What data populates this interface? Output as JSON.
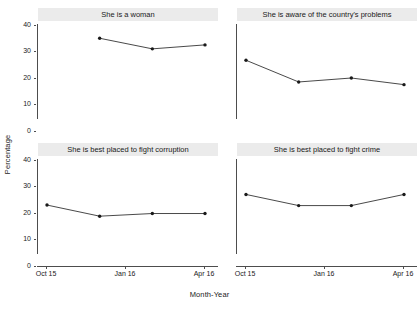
{
  "chart_data": {
    "type": "line",
    "title": "",
    "xlabel": "Month-Year",
    "ylabel": "Percentage",
    "ylim": [
      0,
      42
    ],
    "yticks": [
      0,
      10,
      20,
      30,
      40
    ],
    "ytick_labels": [
      "0",
      "10",
      "20",
      "30",
      "40"
    ],
    "x": [
      "Oct 15",
      "Jan 16",
      "Mar 16",
      "Apr 16"
    ],
    "xtick_labels": [
      "Oct 15",
      "Jan 16",
      "Apr 16"
    ],
    "xticks_index": [
      0,
      1,
      3
    ],
    "grid": false,
    "legend": "none",
    "marker": "filled-circle",
    "line_color": "#1a1a1a",
    "strip_background": "#ebebeb",
    "panel_background": "#ffffff",
    "panels": [
      {
        "id": "she-is-a-woman",
        "title": "She is a woman",
        "categories": [
          "Jan 16",
          "Mar 16",
          "Apr 16"
        ],
        "values": [
          35.0,
          31.0,
          32.5
        ]
      },
      {
        "id": "aware-of-countrys-problems",
        "title": "She is aware of the country's problems",
        "categories": [
          "Oct 15",
          "Jan 16",
          "Mar 16",
          "Apr 16"
        ],
        "values": [
          26.7,
          18.5,
          20.0,
          17.5
        ]
      },
      {
        "id": "best-placed-to-fight-corruption",
        "title": "She is best placed to fight corruption",
        "categories": [
          "Oct 15",
          "Jan 16",
          "Mar 16",
          "Apr 16"
        ],
        "values": [
          23.0,
          18.8,
          19.8,
          19.8
        ]
      },
      {
        "id": "best-placed-to-fight-crime",
        "title": "She is best placed to fight crime",
        "categories": [
          "Oct 15",
          "Jan 16",
          "Mar 16",
          "Apr 16"
        ],
        "values": [
          27.0,
          22.8,
          22.8,
          27.0
        ]
      }
    ]
  }
}
